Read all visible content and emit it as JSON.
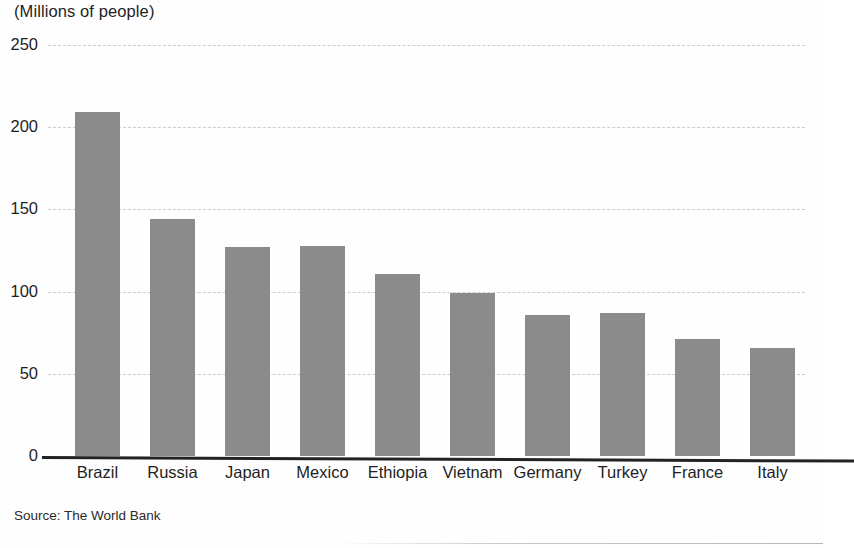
{
  "chart_data": {
    "type": "bar",
    "title": "",
    "subtitle": "",
    "unit_label": "(Millions of people)",
    "xlabel": "",
    "ylabel": "",
    "ylim": [
      0,
      250
    ],
    "yticks": [
      0,
      50,
      100,
      150,
      200,
      250
    ],
    "ytick_labels": [
      "0",
      "50",
      "100",
      "150",
      "200",
      "250"
    ],
    "grid": true,
    "grid_style": "dashed-horizontal",
    "legend": false,
    "legend_position": "none",
    "bar_color": "#8b8b8b",
    "axis_color": "#222325",
    "gridline_color": "#c9ccd1",
    "categories": [
      "Brazil",
      "Russia",
      "Japan",
      "Mexico",
      "Ethiopia",
      "Vietnam",
      "Germany",
      "Turkey",
      "France",
      "Italy"
    ],
    "values": [
      209,
      144,
      127,
      128,
      111,
      99,
      86,
      87,
      71,
      66
    ],
    "source": "Source: The World Bank"
  }
}
